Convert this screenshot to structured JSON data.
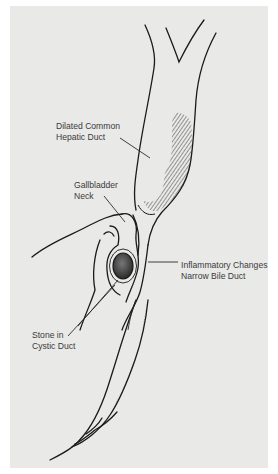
{
  "figure": {
    "background_color": "#e9e9e8",
    "line_color": "#1a1a1a",
    "labels": [
      {
        "id": "dilated-common-hepatic-duct",
        "lines": [
          "Dilated Common",
          "Hepatic Duct"
        ]
      },
      {
        "id": "gallbladder-neck",
        "lines": [
          "Gallbladder",
          "Neck"
        ]
      },
      {
        "id": "inflammatory-changes",
        "lines": [
          "Inflammatory Changes",
          "Narrow Bile Duct"
        ]
      },
      {
        "id": "stone-in-cystic-duct",
        "lines": [
          "Stone in",
          "Cystic Duct"
        ]
      }
    ]
  }
}
